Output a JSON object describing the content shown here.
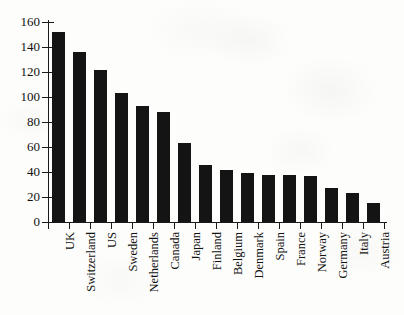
{
  "chart_data": {
    "type": "bar",
    "title": "",
    "subtitle": "",
    "xlabel": "",
    "ylabel": "",
    "categories": [
      "UK",
      "Switzerland",
      "US",
      "Sweden",
      "Netherlands",
      "Canada",
      "Japan",
      "Finland",
      "Belgium",
      "Denmark",
      "Spain",
      "France",
      "Norway",
      "Germany",
      "Italy",
      "Austria"
    ],
    "values": [
      152,
      136,
      122,
      103,
      93,
      88,
      63,
      46,
      42,
      39,
      38,
      38,
      37,
      27,
      23,
      15
    ],
    "series": [
      {
        "name": "",
        "values": [
          152,
          136,
          122,
          103,
          93,
          88,
          63,
          46,
          42,
          39,
          38,
          38,
          37,
          27,
          23,
          15
        ]
      }
    ],
    "ylim": [
      0,
      160
    ],
    "yticks": [
      0,
      20,
      40,
      60,
      80,
      100,
      120,
      140,
      160
    ],
    "ytick_labels": [
      "0",
      "20",
      "40",
      "60",
      "80",
      "100",
      "120",
      "140",
      "160"
    ],
    "grid": false,
    "legend": false,
    "legend_position": "none",
    "orientation": "vertical",
    "bar_color": "#141414",
    "axis_color": "#1a1a1a",
    "background_color": "#fdfdfb",
    "x_tick_style": "between-categories",
    "x_label_rotation": -90,
    "annotations": []
  }
}
